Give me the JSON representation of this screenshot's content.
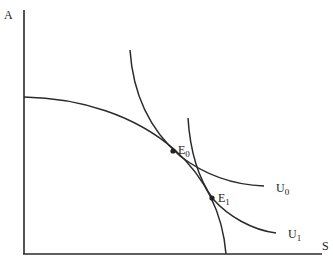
{
  "diagram": {
    "type": "economics-ppf-indifference",
    "axes": {
      "y_label": "A",
      "x_label": "S"
    },
    "curves": {
      "ppf": {
        "name": "production-possibility-frontier"
      },
      "u0": {
        "label_main": "U",
        "label_sub": "0"
      },
      "u1": {
        "label_main": "U",
        "label_sub": "1"
      }
    },
    "points": {
      "e0": {
        "label_main": "E",
        "label_sub": "0"
      },
      "e1": {
        "label_main": "E",
        "label_sub": "1"
      }
    },
    "colors": {
      "line": "#2a2a2a",
      "text": "#222222",
      "background": "#ffffff"
    }
  }
}
